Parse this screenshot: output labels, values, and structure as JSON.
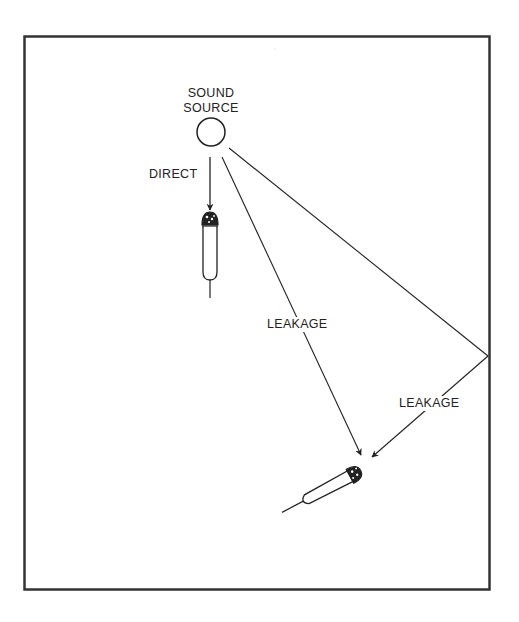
{
  "diagram": {
    "labels": {
      "source_line1": "SOUND",
      "source_line2": "SOURCE",
      "direct": "DIRECT",
      "leakage_direct": "LEAKAGE",
      "leakage_reflected": "LEAKAGE"
    },
    "elements": {
      "frame": {
        "x": 24,
        "y": 36,
        "width": 466,
        "height": 554
      },
      "sound_source": {
        "cx": 211,
        "cy": 132,
        "r": 14
      },
      "mic_direct": {
        "head_cx": 210,
        "head_cy": 220,
        "orientation": "vertical"
      },
      "mic_leakage": {
        "head_cx": 358,
        "head_cy": 472,
        "orientation": "diagonal"
      },
      "reflection_point": {
        "x": 488,
        "y": 356
      }
    },
    "colors": {
      "line": "#222222",
      "background": "#ffffff"
    }
  }
}
